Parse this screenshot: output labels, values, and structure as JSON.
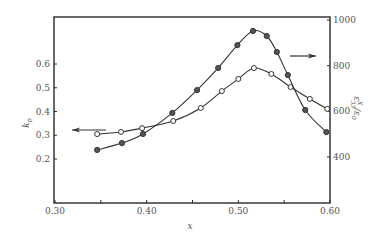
{
  "chart_data": {
    "type": "line",
    "title": "",
    "xlabel": "x",
    "ylabel_left": "k_p",
    "ylabel_right": "ε^X_33/ε_0",
    "xlim": [
      0.3,
      0.6
    ],
    "ylim_left": [
      0.1,
      0.75
    ],
    "ylim_right": [
      200,
      1000
    ],
    "x_ticks": [
      0.3,
      0.35,
      0.4,
      0.45,
      0.5,
      0.55,
      0.6
    ],
    "x_tick_labels": [
      "0.30",
      "",
      "0.40",
      "",
      "0.50",
      "",
      "0.60"
    ],
    "y_left_ticks": [
      0.2,
      0.3,
      0.4,
      0.5,
      0.6
    ],
    "y_left_tick_labels": [
      "0.2",
      "0.3",
      "0.4",
      "0.5",
      "0.6"
    ],
    "y_right_ticks": [
      400,
      600,
      800,
      1000
    ],
    "y_right_tick_labels": [
      "400",
      "600",
      "800",
      "1000"
    ],
    "grid": false,
    "legend": "none (arrows indicate axis)",
    "series": [
      {
        "name": "k_p",
        "axis": "left",
        "marker": "open-circle",
        "arrow": "left",
        "x": [
          0.346,
          0.372,
          0.395,
          0.429,
          0.459,
          0.482,
          0.5,
          0.517,
          0.536,
          0.557,
          0.578,
          0.597
        ],
        "values": [
          0.305,
          0.314,
          0.33,
          0.36,
          0.415,
          0.486,
          0.537,
          0.583,
          0.558,
          0.503,
          0.453,
          0.411
        ]
      },
      {
        "name": "ε^X_33/ε_0",
        "axis": "right",
        "marker": "filled-circle",
        "arrow": "right",
        "x": [
          0.346,
          0.373,
          0.396,
          0.428,
          0.455,
          0.478,
          0.499,
          0.516,
          0.531,
          0.542,
          0.554,
          0.573,
          0.596
        ],
        "values": [
          431,
          461,
          501,
          593,
          693,
          790,
          890,
          952,
          930,
          860,
          759,
          606,
          509
        ]
      }
    ],
    "annotations": [
      {
        "type": "arrow",
        "direction": "left",
        "points_to": "left axis (k_p)"
      },
      {
        "type": "arrow",
        "direction": "right",
        "points_to": "right axis (ε^X_33/ε_0)"
      }
    ]
  },
  "layout": {
    "frame": {
      "left": 54,
      "top": 17,
      "right": 330,
      "bottom": 203
    },
    "x_map": {
      "v0": 0.3,
      "p0": 55,
      "v1": 0.6,
      "p1": 330
    },
    "yl_map": {
      "v0": 0.6,
      "p0": 64,
      "v1": 0.2,
      "p1": 159
    },
    "yr_map": {
      "v0": 1000,
      "p0": 20,
      "v1": 400,
      "p1": 157
    },
    "left_arrow": {
      "x1": 106,
      "x2": 72,
      "y": 130
    },
    "right_arrow": {
      "x1": 290,
      "x2": 316,
      "y": 56
    },
    "colors": {
      "line": "#333333",
      "filled_marker": "#555555",
      "open_marker_fill": "#ffffff",
      "frame": "#2a2a2a",
      "text": "#555555"
    }
  }
}
